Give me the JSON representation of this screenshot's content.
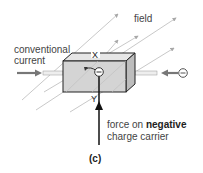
{
  "figure": {
    "panel_label": "(c)",
    "labels": {
      "field": "field",
      "conventional_current_line1": "conventional",
      "conventional_current_line2": "current",
      "x_axis": "X",
      "y_axis": "Y",
      "force_prefix": "force on ",
      "force_bold": "negative",
      "force_line2": "charge carrier"
    },
    "symbols": {
      "charge_on_box": "−",
      "charge_incoming": "−"
    },
    "colors": {
      "box_fill": "#d4d4d4",
      "box_top": "#e6e6e6",
      "box_side": "#bdbdbd",
      "outline": "#222222",
      "field_lines": "#a8a8a8",
      "current_arrow": "#777777",
      "force_arrow": "#111111"
    }
  }
}
